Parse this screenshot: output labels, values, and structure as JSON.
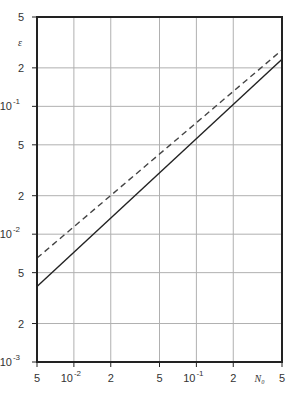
{
  "chart_data": {
    "type": "line",
    "title": "",
    "xlabel": "N₀",
    "ylabel": "ε",
    "xscale": "log",
    "yscale": "log",
    "xlim": [
      0.005,
      0.5
    ],
    "ylim": [
      0.001,
      0.5
    ],
    "grid": true,
    "legend": null,
    "x_ticks": [
      {
        "value": 0.005,
        "label": "5"
      },
      {
        "value": 0.01,
        "label": "10",
        "exp": "-2"
      },
      {
        "value": 0.02,
        "label": "2"
      },
      {
        "value": 0.05,
        "label": "5"
      },
      {
        "value": 0.1,
        "label": "10",
        "exp": "-1"
      },
      {
        "value": 0.2,
        "label": "2"
      },
      {
        "value": 0.5,
        "label": "5"
      }
    ],
    "y_ticks": [
      {
        "value": 0.5,
        "label": "5"
      },
      {
        "value": 0.2,
        "label": "2"
      },
      {
        "value": 0.1,
        "label": "10",
        "exp": "-1"
      },
      {
        "value": 0.05,
        "label": "5"
      },
      {
        "value": 0.02,
        "label": "2"
      },
      {
        "value": 0.01,
        "label": "10",
        "exp": "-2"
      },
      {
        "value": 0.005,
        "label": "5"
      },
      {
        "value": 0.002,
        "label": "2"
      },
      {
        "value": 0.001,
        "label": "10",
        "exp": "-3"
      }
    ],
    "series": [
      {
        "name": "solid",
        "style": "solid",
        "color": "#222222",
        "x": [
          0.005,
          0.5
        ],
        "y": [
          0.0039,
          0.234
        ]
      },
      {
        "name": "dashed",
        "style": "dashed",
        "color": "#444444",
        "x": [
          0.005,
          0.5
        ],
        "y": [
          0.0065,
          0.276
        ]
      }
    ]
  },
  "colors": {
    "frame": "#222222",
    "grid": "#b0b0b0",
    "background": "#ffffff"
  }
}
